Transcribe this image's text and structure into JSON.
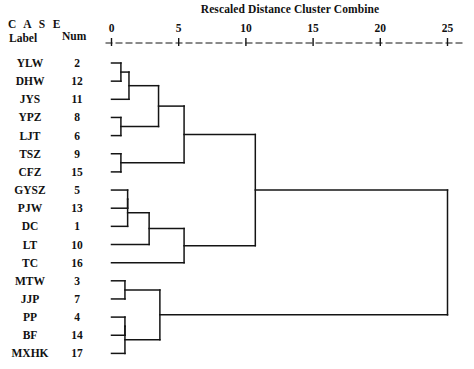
{
  "chart_data": {
    "type": "dendrogram",
    "title": "Rescaled Distance Cluster Combine",
    "xlabel": "Rescaled Distance Cluster Combine",
    "ylabel": "",
    "xlim": [
      0,
      25
    ],
    "grid": false,
    "legend": null,
    "axis_ticks": [
      {
        "value": 0,
        "label": "0"
      },
      {
        "value": 5,
        "label": "5"
      },
      {
        "value": 10,
        "label": "10"
      },
      {
        "value": 15,
        "label": "15"
      },
      {
        "value": 20,
        "label": "20"
      },
      {
        "value": 25,
        "label": "25"
      }
    ],
    "column_headers": {
      "case": "C A S E",
      "label": "Label",
      "num": "Num"
    },
    "leaves": [
      {
        "label": "YLW",
        "num": "2"
      },
      {
        "label": "DHW",
        "num": "12"
      },
      {
        "label": "JYS",
        "num": "11"
      },
      {
        "label": "YPZ",
        "num": "8"
      },
      {
        "label": "LJT",
        "num": "6"
      },
      {
        "label": "TSZ",
        "num": "9"
      },
      {
        "label": "CFZ",
        "num": "15"
      },
      {
        "label": "GYSZ",
        "num": "5"
      },
      {
        "label": "PJW",
        "num": "13"
      },
      {
        "label": "DC",
        "num": "1"
      },
      {
        "label": "LT",
        "num": "10"
      },
      {
        "label": "TC",
        "num": "16"
      },
      {
        "label": "MTW",
        "num": "3"
      },
      {
        "label": "JJP",
        "num": "7"
      },
      {
        "label": "PP",
        "num": "4"
      },
      {
        "label": "BF",
        "num": "14"
      },
      {
        "label": "MXHK",
        "num": "17"
      }
    ],
    "merges": [
      {
        "id": "m1",
        "children": [
          "YLW",
          "DHW"
        ],
        "distance": 0.7
      },
      {
        "id": "m2",
        "children": [
          "YPZ",
          "LJT"
        ],
        "distance": 0.7
      },
      {
        "id": "m3",
        "children": [
          "m1",
          "JYS"
        ],
        "distance": 1.3
      },
      {
        "id": "m4",
        "children": [
          "TSZ",
          "CFZ"
        ],
        "distance": 0.7
      },
      {
        "id": "m5",
        "children": [
          "GYSZ",
          "PJW"
        ],
        "distance": 1.2
      },
      {
        "id": "m6",
        "children": [
          "m5",
          "DC"
        ],
        "distance": 1.2
      },
      {
        "id": "m7",
        "children": [
          "MTW",
          "JJP"
        ],
        "distance": 1.0
      },
      {
        "id": "m8",
        "children": [
          "PP",
          "BF"
        ],
        "distance": 1.0
      },
      {
        "id": "m9",
        "children": [
          "m8",
          "MXHK"
        ],
        "distance": 1.0
      },
      {
        "id": "m10",
        "children": [
          "m3",
          "m2"
        ],
        "distance": 3.5
      },
      {
        "id": "m11",
        "children": [
          "m10",
          "m4"
        ],
        "distance": 5.4
      },
      {
        "id": "m12",
        "children": [
          "m6",
          "LT"
        ],
        "distance": 2.8
      },
      {
        "id": "m13",
        "children": [
          "m12",
          "TC"
        ],
        "distance": 5.4
      },
      {
        "id": "m14",
        "children": [
          "m11",
          "m13"
        ],
        "distance": 10.7
      },
      {
        "id": "m15",
        "children": [
          "m7",
          "m9"
        ],
        "distance": 3.6
      },
      {
        "id": "m16",
        "children": [
          "m14",
          "m15"
        ],
        "distance": 25.0
      }
    ]
  }
}
